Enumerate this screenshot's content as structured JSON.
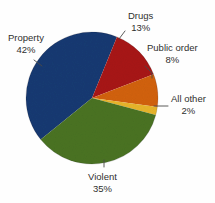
{
  "chart_data": {
    "type": "pie",
    "title": "",
    "subtitle": "",
    "xlabel": "",
    "ylabel": "",
    "legend_position": "callout-labels",
    "grid": false,
    "units": "percent",
    "categories": [
      "Property",
      "Violent",
      "Drugs",
      "Public order",
      "All other"
    ],
    "values": [
      42,
      35,
      13,
      8,
      2
    ],
    "colors": [
      "#173a72",
      "#4a7322",
      "#a81616",
      "#d2620f",
      "#e8b52a"
    ],
    "slices": [
      {
        "label": "Property",
        "value": 42,
        "value_text": "42%",
        "color": "#173a72",
        "start_angle": 141,
        "end_angle": 292.2
      },
      {
        "label": "Drugs",
        "value": 13,
        "value_text": "13%",
        "color": "#a81616",
        "start_angle": 292.2,
        "end_angle": 339
      },
      {
        "label": "Public order",
        "value": 8,
        "value_text": "8%",
        "color": "#d2620f",
        "start_angle": 339,
        "end_angle": 367.8
      },
      {
        "label": "All other",
        "value": 2,
        "value_text": "2%",
        "color": "#e8b52a",
        "start_angle": 367.8,
        "end_angle": 375
      },
      {
        "label": "Violent",
        "value": 35,
        "value_text": "35%",
        "color": "#4a7322",
        "start_angle": 375,
        "end_angle": 501
      }
    ]
  },
  "labels": {
    "property": {
      "name": "Property",
      "pct": "42%"
    },
    "drugs": {
      "name": "Drugs",
      "pct": "13%"
    },
    "public_order": {
      "name": "Public order",
      "pct": "8%"
    },
    "all_other": {
      "name": "All other",
      "pct": "2%"
    },
    "violent": {
      "name": "Violent",
      "pct": "35%"
    }
  }
}
